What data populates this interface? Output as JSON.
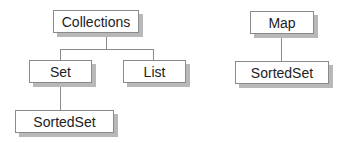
{
  "diagram": {
    "type": "class-hierarchy",
    "left_tree": {
      "root": "Collections",
      "children": [
        "Set",
        "List"
      ],
      "grandchildren": {
        "Set": [
          "SortedSet"
        ]
      }
    },
    "right_tree": {
      "root": "Map",
      "children": [
        "SortedSet"
      ]
    },
    "nodes": {
      "collections": "Collections",
      "set": "Set",
      "list": "List",
      "sortedset_left": "SortedSet",
      "map": "Map",
      "sortedset_right": "SortedSet"
    },
    "colors": {
      "border": "#8a8a8a",
      "shadow": "#b8b8b8",
      "text": "#222222",
      "background": "#ffffff"
    }
  }
}
